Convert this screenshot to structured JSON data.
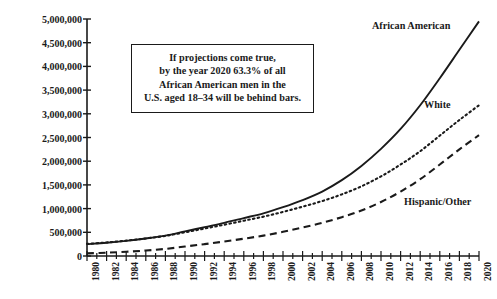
{
  "chart_data": {
    "type": "line",
    "title": "",
    "xlabel": "",
    "ylabel": "Number of People in Custody",
    "xlim": [
      1980,
      2020
    ],
    "ylim": [
      0,
      5000000
    ],
    "grid": false,
    "legend_position": "inline-right",
    "ytick_labels": [
      "5,000,000",
      "4,500,000",
      "4,000,000",
      "3,500,000",
      "3,000,000",
      "2,500,000",
      "2,000,000",
      "1,500,000",
      "1,000,000",
      "500,000",
      "0"
    ],
    "ytick_values": [
      5000000,
      4500000,
      4000000,
      3500000,
      3000000,
      2500000,
      2000000,
      1500000,
      1000000,
      500000,
      0
    ],
    "xtick_labels": [
      "1980",
      "1982",
      "1984",
      "1986",
      "1988",
      "1990",
      "1992",
      "1994",
      "1996",
      "1998",
      "2000",
      "2002",
      "2004",
      "2006",
      "2008",
      "2010",
      "2012",
      "2014",
      "2016",
      "2018",
      "2020"
    ],
    "x": [
      1980,
      1982,
      1984,
      1986,
      1988,
      1990,
      1992,
      1994,
      1996,
      1998,
      2000,
      2002,
      2004,
      2006,
      2008,
      2010,
      2012,
      2014,
      2016,
      2018,
      2020
    ],
    "series": [
      {
        "name": "African American",
        "style": "solid",
        "color": "#1a1a1a",
        "values": [
          250000,
          280000,
          320000,
          370000,
          430000,
          520000,
          610000,
          700000,
          800000,
          900000,
          1030000,
          1180000,
          1360000,
          1600000,
          1900000,
          2260000,
          2680000,
          3180000,
          3750000,
          4350000,
          4950000
        ]
      },
      {
        "name": "White",
        "style": "dotted",
        "color": "#1a1a1a",
        "values": [
          255000,
          285000,
          325000,
          370000,
          425000,
          500000,
          580000,
          660000,
          745000,
          830000,
          930000,
          1040000,
          1160000,
          1300000,
          1470000,
          1680000,
          1930000,
          2210000,
          2540000,
          2870000,
          3180000
        ]
      },
      {
        "name": "Hispanic/Other",
        "style": "dashed",
        "color": "#1a1a1a",
        "values": [
          55000,
          70000,
          90000,
          115000,
          150000,
          200000,
          250000,
          305000,
          365000,
          430000,
          510000,
          600000,
          700000,
          820000,
          960000,
          1140000,
          1360000,
          1620000,
          1930000,
          2250000,
          2550000
        ]
      }
    ],
    "annotation": {
      "lines": [
        "If projections come true,",
        "by the year 2020 63.3% of all",
        "African American men in the",
        "U.S. aged 18–34 will be behind bars."
      ]
    }
  }
}
